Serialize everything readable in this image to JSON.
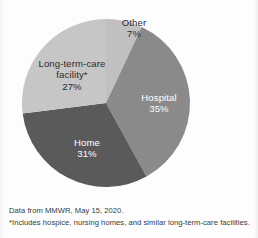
{
  "chart_data": {
    "type": "pie",
    "title": "",
    "subtitle": "",
    "xlabel": "",
    "ylabel": "",
    "legend_position": "none",
    "grid": false,
    "start_angle_deg": 0,
    "direction": "clockwise",
    "units": "percent",
    "categories": [
      "Other",
      "Hospital",
      "Home",
      "Long-term-care facility*"
    ],
    "values": [
      7,
      35,
      31,
      27
    ],
    "slices": [
      {
        "label": "Other",
        "value": 7,
        "value_text": "7%",
        "color": "#c0c0c0",
        "text_color": "#2b2b2b",
        "label_lines": [
          "Other"
        ]
      },
      {
        "label": "Hospital",
        "value": 35,
        "value_text": "35%",
        "color": "#8a8a8a",
        "text_color": "#ffffff",
        "label_lines": [
          "Hospital"
        ]
      },
      {
        "label": "Home",
        "value": 31,
        "value_text": "31%",
        "color": "#5a5a5a",
        "text_color": "#ffffff",
        "label_lines": [
          "Home"
        ]
      },
      {
        "label": "Long-term-care facility*",
        "value": 27,
        "value_text": "27%",
        "color": "#c6c6c6",
        "text_color": "#2b2b2b",
        "label_lines": [
          "Long-term-care",
          "facility*"
        ]
      }
    ],
    "annotations": [
      "Data from MMWR, May 15, 2020.",
      "*Includes hospice, nursing homes, and similar long-term-care facilities."
    ]
  },
  "labels": {
    "other": {
      "name": "Other",
      "value": "7%"
    },
    "hospital": {
      "name": "Hospital",
      "value": "35%"
    },
    "home": {
      "name": "Home",
      "value": "31%"
    },
    "ltc": {
      "name_line1": "Long-term-care",
      "name_line2": "facility*",
      "value": "27%"
    }
  },
  "footnotes": {
    "source": "Data from MMWR, May 15, 2020.",
    "note": "*Includes hospice, nursing homes, and similar long-term-care facilities."
  }
}
